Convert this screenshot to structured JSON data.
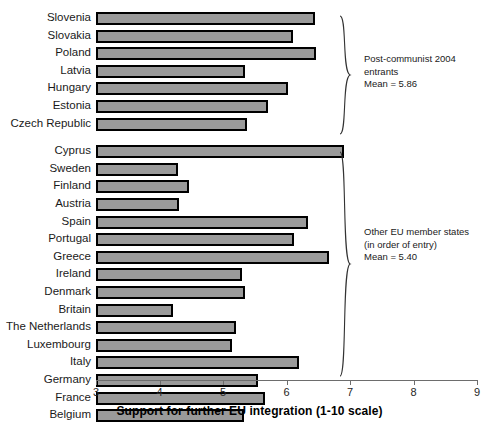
{
  "chart_data": {
    "type": "bar",
    "orientation": "horizontal",
    "title": "",
    "xlabel": "Support for further EU integration (1-10 scale)",
    "ylabel": "",
    "xlim": [
      3,
      9
    ],
    "xticks": [
      3,
      4,
      5,
      6,
      7,
      8,
      9
    ],
    "xtick_labels": [
      "3",
      "4",
      "5",
      "6",
      "7",
      "8",
      "9"
    ],
    "grid": false,
    "legend": "none",
    "bar_color": "#9a9a9a",
    "bar_edge_color": "#000000",
    "categories": [
      "Slovenia",
      "Slovakia",
      "Poland",
      "Latvia",
      "Hungary",
      "Estonia",
      "Czech Republic",
      "Cyprus",
      "Sweden",
      "Finland",
      "Austria",
      "Spain",
      "Portugal",
      "Greece",
      "Ireland",
      "Denmark",
      "Britain",
      "The Netherlands",
      "Luxembourg",
      "Italy",
      "Germany",
      "France",
      "Belgium"
    ],
    "values": [
      6.45,
      6.1,
      6.46,
      5.35,
      6.02,
      5.71,
      5.38,
      6.9,
      4.29,
      4.46,
      4.31,
      6.34,
      6.12,
      6.67,
      5.3,
      5.35,
      4.21,
      5.21,
      5.14,
      6.19,
      5.55,
      5.66,
      5.33
    ],
    "groups": [
      {
        "name": "Post-communist 2004 entrants",
        "annotation_lines": [
          "Post-communist 2004",
          "entrants",
          "Mean = 5.86"
        ],
        "mean": 5.86,
        "categories": [
          "Slovenia",
          "Slovakia",
          "Poland",
          "Latvia",
          "Hungary",
          "Estonia",
          "Czech Republic"
        ]
      },
      {
        "name": "Other EU member states (in order of entry)",
        "annotation_lines": [
          "Other EU member states",
          "(in order of entry)",
          "Mean = 5.40"
        ],
        "mean": 5.4,
        "categories": [
          "Cyprus",
          "Sweden",
          "Finland",
          "Austria",
          "Spain",
          "Portugal",
          "Greece",
          "Ireland",
          "Denmark",
          "Britain",
          "The Netherlands",
          "Luxembourg",
          "Italy",
          "Germany",
          "France",
          "Belgium"
        ]
      }
    ]
  },
  "axis": {
    "title": "Support for further EU integration (1-10 scale)",
    "ticks": [
      "3",
      "4",
      "5",
      "6",
      "7",
      "8",
      "9"
    ]
  },
  "annotations": {
    "group1": "Post-communist 2004\nentrants\nMean = 5.86",
    "group2": "Other EU member states\n(in order of entry)\nMean = 5.40"
  }
}
